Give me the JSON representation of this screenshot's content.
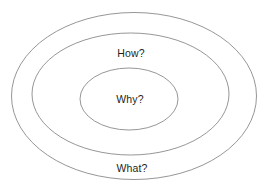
{
  "diagram": {
    "type": "concentric-ellipses",
    "background_color": "#ffffff",
    "stroke_color": "#8a8a8a",
    "text_color": "#231f20",
    "rings": [
      {
        "id": "outer",
        "label": "What?",
        "label_position": "bottom",
        "cx": 134,
        "cy": 96,
        "rx": 123,
        "ry": 84
      },
      {
        "id": "middle",
        "label": "How?",
        "label_position": "top",
        "cx": 130.5,
        "cy": 94,
        "rx": 98.5,
        "ry": 61
      },
      {
        "id": "inner",
        "label": "Why?",
        "label_position": "center",
        "cx": 129,
        "cy": 99,
        "rx": 49,
        "ry": 31
      }
    ],
    "labels": {
      "outer": "What?",
      "middle": "How?",
      "inner": "Why?"
    }
  }
}
